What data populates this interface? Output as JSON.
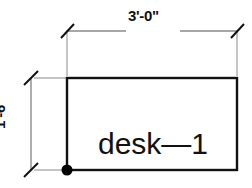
{
  "drawing": {
    "title": "desk plan dimension drawing",
    "background_color": "#ffffff",
    "outline_color": "#111111",
    "dimension_line_color": "#8a8a8a",
    "tick_color": "#111111",
    "marker_color": "#000000"
  },
  "dimensions": {
    "top": {
      "label": "3'-0\"",
      "orientation": "horizontal",
      "tick_style": "architectural-slash"
    },
    "left": {
      "label": "1'-6\"",
      "orientation": "vertical",
      "tick_style": "architectural-slash"
    }
  },
  "object": {
    "label": "desk—1",
    "shape": "rectangle",
    "insertion_point_marker": "filled-dot"
  }
}
